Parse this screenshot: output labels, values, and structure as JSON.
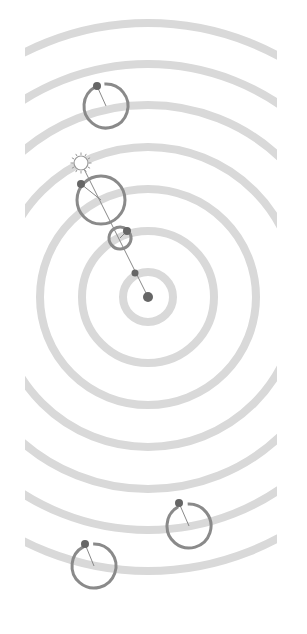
{
  "figure": {
    "width": 307,
    "height": 634,
    "background": "#ffffff",
    "clip": {
      "x": 25,
      "y": 0,
      "width": 252,
      "height": 634
    },
    "center": {
      "x": 148,
      "y": 297
    },
    "colors": {
      "ring": "#d9d9d9",
      "orbit": "#8a8a8a",
      "dot": "#666666",
      "line": "#888888",
      "sun_stroke": "#999999"
    },
    "rings": [
      25,
      66,
      108,
      150,
      192,
      233,
      274
    ],
    "ring_width": 8,
    "central_body": {
      "x": 148,
      "y": 297,
      "r": 5
    },
    "inner_marker": {
      "x": 135,
      "y": 273,
      "r": 3.5
    },
    "sun": {
      "x": 81,
      "y": 163,
      "r": 7
    },
    "ray_line": {
      "x1": 81,
      "y1": 163,
      "x2": 148,
      "y2": 297
    },
    "orbiters": [
      {
        "name": "orbiter-top",
        "cx": 106,
        "cy": 106,
        "r": 22,
        "dot": {
          "x": 97,
          "y": 86
        },
        "gap": true
      },
      {
        "name": "orbiter-upper",
        "cx": 101,
        "cy": 200,
        "r": 24,
        "dot": {
          "x": 81,
          "y": 184
        },
        "gap": false
      },
      {
        "name": "orbiter-small",
        "cx": 120,
        "cy": 238,
        "r": 11,
        "dot": {
          "x": 127,
          "y": 231
        },
        "gap": true
      },
      {
        "name": "orbiter-lower-right",
        "cx": 189,
        "cy": 526,
        "r": 22,
        "dot": {
          "x": 179,
          "y": 503
        },
        "gap": true
      },
      {
        "name": "orbiter-lower-left",
        "cx": 94,
        "cy": 566,
        "r": 22,
        "dot": {
          "x": 85,
          "y": 544
        },
        "gap": true
      }
    ]
  }
}
